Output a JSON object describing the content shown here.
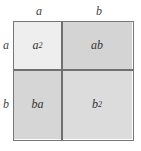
{
  "diagram": {
    "title": "",
    "type": "area-model",
    "column_labels": [
      "a",
      "b"
    ],
    "row_labels": [
      "a",
      "b"
    ],
    "cells": [
      {
        "row": 0,
        "col": 0,
        "base": "a",
        "exp": "2",
        "fill": "#eeeeee"
      },
      {
        "row": 0,
        "col": 1,
        "base": "ab",
        "exp": "",
        "fill": "#d4d4d4"
      },
      {
        "row": 1,
        "col": 0,
        "base": "ba",
        "exp": "",
        "fill": "#d6d6d6"
      },
      {
        "row": 1,
        "col": 1,
        "base": "b",
        "exp": "2",
        "fill": "#dcdcdc"
      }
    ],
    "border_color": "#777777"
  }
}
